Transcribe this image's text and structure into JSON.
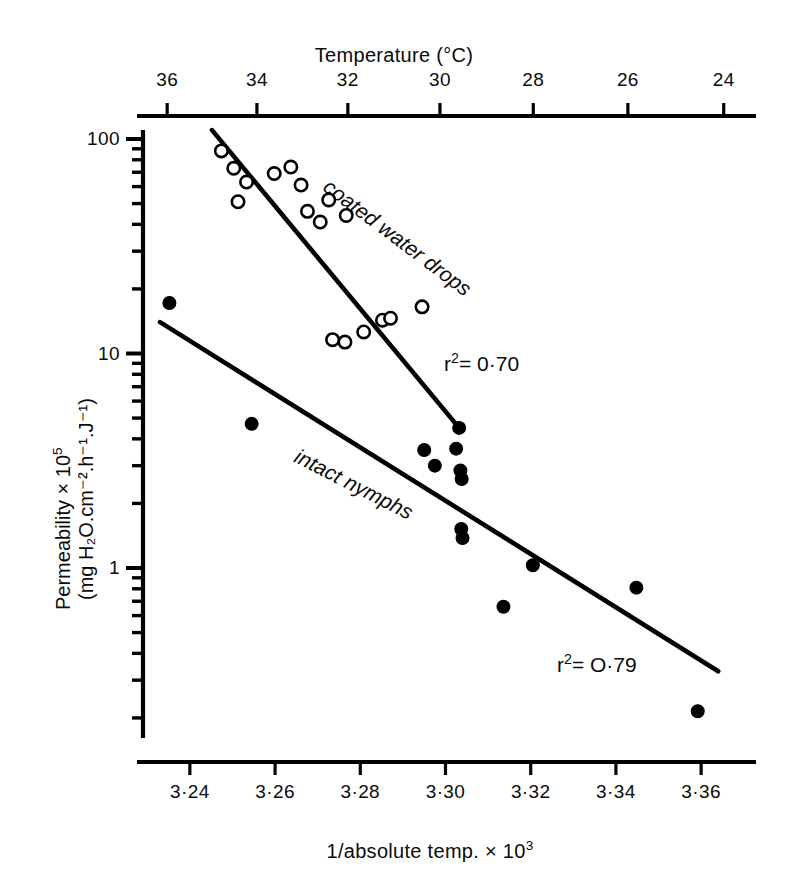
{
  "chart_data": {
    "type": "scatter",
    "title": "",
    "xlabel": "1/absolute temp. × 10³",
    "x_top_label": "Temperature (°C)",
    "ylabel_line1": "Permeability × 10",
    "ylabel_line1_sup": "5",
    "ylabel_line2": "(mg H₂O.cm⁻².h⁻¹.J⁻¹)",
    "yscale": "log",
    "ylim": [
      0.18,
      130
    ],
    "xlim": [
      3.229,
      3.371
    ],
    "grid": false,
    "legend_position": "inline-annotations",
    "x_ticks": [
      "3·24",
      "3·26",
      "3·28",
      "3·30",
      "3·32",
      "3·34",
      "3·36"
    ],
    "x_tick_values": [
      3.24,
      3.26,
      3.28,
      3.3,
      3.32,
      3.34,
      3.36
    ],
    "x_top_ticks": [
      "36",
      "34",
      "32",
      "30",
      "28",
      "26",
      "24"
    ],
    "x_top_tick_values": [
      36,
      34,
      32,
      30,
      28,
      26,
      24
    ],
    "y_ticks": [
      "100",
      "10",
      "1"
    ],
    "y_tick_values": [
      100,
      10,
      1
    ],
    "y_minor_values": [
      90,
      80,
      70,
      60,
      50,
      40,
      30,
      20,
      9,
      8,
      7,
      6,
      5,
      4,
      3,
      2,
      0.9,
      0.8,
      0.7,
      0.6,
      0.5,
      0.4,
      0.3,
      0.2
    ],
    "series": [
      {
        "name": "coated water drops",
        "marker": "open-circle",
        "color": "#000000",
        "label_text": "coated water drops",
        "r_squared_text": "r²= 0·70",
        "r_squared": 0.7,
        "points": [
          {
            "x": 3.2474,
            "y": 88
          },
          {
            "x": 3.2503,
            "y": 73
          },
          {
            "x": 3.2533,
            "y": 63
          },
          {
            "x": 3.2513,
            "y": 51
          },
          {
            "x": 3.2598,
            "y": 69
          },
          {
            "x": 3.2637,
            "y": 74
          },
          {
            "x": 3.2661,
            "y": 61
          },
          {
            "x": 3.2676,
            "y": 46
          },
          {
            "x": 3.2706,
            "y": 41
          },
          {
            "x": 3.2726,
            "y": 52
          },
          {
            "x": 3.2767,
            "y": 44
          },
          {
            "x": 3.2735,
            "y": 11.6
          },
          {
            "x": 3.2764,
            "y": 11.3
          },
          {
            "x": 3.2808,
            "y": 12.6
          },
          {
            "x": 3.2852,
            "y": 14.3
          },
          {
            "x": 3.2871,
            "y": 14.6
          },
          {
            "x": 3.2945,
            "y": 16.5
          }
        ],
        "fit_line": {
          "x1": 3.2452,
          "y1": 110,
          "x2": 3.3032,
          "y2": 4.5
        }
      },
      {
        "name": "intact nymphs",
        "marker": "filled-circle",
        "color": "#000000",
        "label_text": "intact nymphs",
        "r_squared_text": "r²= O·79",
        "r_squared": 0.79,
        "points": [
          {
            "x": 3.2352,
            "y": 17.2
          },
          {
            "x": 3.2545,
            "y": 4.7
          },
          {
            "x": 3.295,
            "y": 3.55
          },
          {
            "x": 3.2975,
            "y": 3.0
          },
          {
            "x": 3.3025,
            "y": 3.6
          },
          {
            "x": 3.3032,
            "y": 4.5
          },
          {
            "x": 3.3035,
            "y": 2.85
          },
          {
            "x": 3.3038,
            "y": 2.6
          },
          {
            "x": 3.3037,
            "y": 1.52
          },
          {
            "x": 3.304,
            "y": 1.38
          },
          {
            "x": 3.3136,
            "y": 0.66
          },
          {
            "x": 3.3205,
            "y": 1.03
          },
          {
            "x": 3.3448,
            "y": 0.81
          },
          {
            "x": 3.3592,
            "y": 0.215
          }
        ],
        "fit_line": {
          "x1": 3.233,
          "y1": 14.0,
          "x2": 3.364,
          "y2": 0.33
        }
      }
    ]
  }
}
